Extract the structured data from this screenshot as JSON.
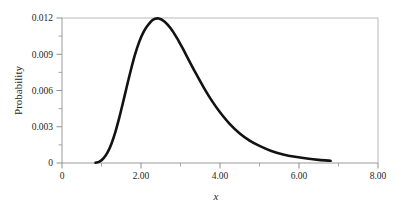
{
  "chart_data": {
    "type": "line",
    "title": "",
    "xlabel": "x",
    "ylabel": "Probability",
    "xlim": [
      0,
      8
    ],
    "ylim": [
      0,
      0.012
    ],
    "grid": false,
    "legend": null,
    "x_ticks": [
      {
        "value": 0,
        "label": "0"
      },
      {
        "value": 2,
        "label": "2.00"
      },
      {
        "value": 4,
        "label": "4.00"
      },
      {
        "value": 6,
        "label": "6.00"
      },
      {
        "value": 8,
        "label": "8.00"
      }
    ],
    "x_minor_ticks": [
      1,
      3,
      5,
      7
    ],
    "y_ticks": [
      {
        "value": 0,
        "label": "0"
      },
      {
        "value": 0.003,
        "label": "0.003"
      },
      {
        "value": 0.006,
        "label": "0.006"
      },
      {
        "value": 0.009,
        "label": "0.009"
      },
      {
        "value": 0.012,
        "label": "0.012"
      }
    ],
    "y_minor_ticks": [
      0.0015,
      0.0045,
      0.0075,
      0.0105
    ],
    "series": [
      {
        "name": "Probability density",
        "color": "#121212",
        "line_width": 2.6,
        "x": [
          0.85,
          0.95,
          1.05,
          1.15,
          1.25,
          1.35,
          1.45,
          1.55,
          1.65,
          1.75,
          1.85,
          1.95,
          2.05,
          2.15,
          2.3,
          2.45,
          2.6,
          2.75,
          2.9,
          3.05,
          3.2,
          3.4,
          3.6,
          3.8,
          4.0,
          4.25,
          4.5,
          4.75,
          5.0,
          5.3,
          5.6,
          5.9,
          6.2,
          6.5,
          6.8
        ],
        "values": [
          2e-05,
          0.00012,
          0.00038,
          0.00085,
          0.00158,
          0.00255,
          0.00375,
          0.00508,
          0.00645,
          0.00778,
          0.00898,
          0.00998,
          0.01075,
          0.0113,
          0.01185,
          0.01196,
          0.0117,
          0.01115,
          0.0104,
          0.00952,
          0.00858,
          0.00735,
          0.00618,
          0.00512,
          0.0042,
          0.00322,
          0.00245,
          0.00186,
          0.00142,
          0.001,
          0.00071,
          0.00051,
          0.00037,
          0.00026,
          0.00018
        ]
      }
    ],
    "annotations": {
      "peak_x": 2.3,
      "peak_y": 0.012,
      "curve_start_x": 0.85,
      "curve_end_x": 6.8
    },
    "colors": {
      "curve": "#121212",
      "frame": "#b4b4b4",
      "tick": "#9a9a9a",
      "text": "#262626",
      "background": "#ffffff"
    }
  }
}
